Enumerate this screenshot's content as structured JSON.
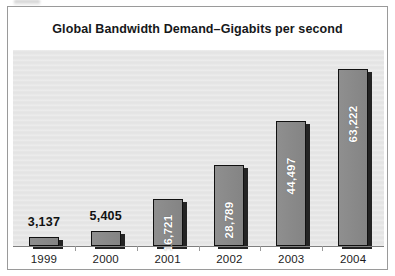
{
  "chart_data": {
    "type": "bar",
    "title": "Global Bandwidth Demand–Gigabits per second",
    "xlabel": "",
    "ylabel": "",
    "categories": [
      "1999",
      "2000",
      "2001",
      "2002",
      "2003",
      "2004"
    ],
    "values": [
      3137,
      5405,
      16721,
      28789,
      44497,
      63222
    ],
    "value_labels": [
      "3,137",
      "5,405",
      "16,721",
      "28,789",
      "44,497",
      "63,222"
    ],
    "label_placement": [
      "above",
      "above",
      "inside",
      "inside",
      "inside",
      "inside"
    ],
    "ylim": [
      0,
      70000
    ],
    "grid": false,
    "legend": null,
    "series": [
      {
        "name": "Global Bandwidth Demand",
        "values": [
          3137,
          5405,
          16721,
          28789,
          44497,
          63222
        ]
      }
    ]
  },
  "style": {
    "plot_background": "#e7e7e7",
    "page_background": "#ffffff",
    "bar_fill": "#8a8a8a",
    "bar_outline": "#111111",
    "bar_shadow": "#242424",
    "inside_label_color": "#ffffff",
    "above_label_color": "#111111",
    "axis_color": "#7f7f7f",
    "frame_color": "#9a9a9a"
  }
}
